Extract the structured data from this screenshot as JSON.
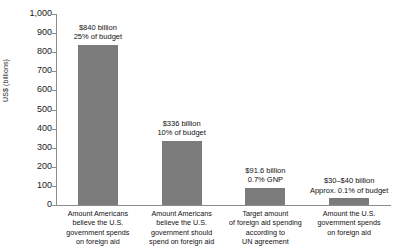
{
  "chart_data": {
    "type": "bar",
    "title": "",
    "subtitle": "",
    "xlabel": "",
    "ylabel": "US$ (billions)",
    "ylim": [
      0,
      1000
    ],
    "ytick_values": [
      1000,
      900,
      800,
      700,
      600,
      500,
      400,
      300,
      200,
      100,
      0
    ],
    "ytick_labels": [
      "1,000",
      "900",
      "800",
      "700",
      "600",
      "500",
      "400",
      "300",
      "200",
      "100",
      "0"
    ],
    "grid": false,
    "legend": null,
    "bar_color": "#7b7b7b",
    "axis_color": "#8c8c8c",
    "categories": [
      "Amount Americans believe the U.S. government spends on foreign aid",
      "Amount Americans believe the U.S. government should spend on foreign aid",
      "Target amount of foreign aid spending according to UN agreement",
      "Amount the U.S. government spends on foreign aid"
    ],
    "category_lines": [
      [
        "Amount Americans",
        "believe the U.S.",
        "government spends",
        "on foreign aid"
      ],
      [
        "Amount Americans",
        "believe the U.S.",
        "government should",
        "spend on foreign aid"
      ],
      [
        "Target amount",
        "of foreign aid spending",
        "according to",
        "UN agreement"
      ],
      [
        "Amount the U.S.",
        "government spends",
        "on foreign aid"
      ]
    ],
    "values": [
      840,
      336,
      91.6,
      35
    ],
    "data_labels": [
      {
        "line1": "$840 billion",
        "line2": "25% of budget"
      },
      {
        "line1": "$336 billion",
        "line2": "10% of budget"
      },
      {
        "line1": "$91.6 billion",
        "line2": "0.7% GNP"
      },
      {
        "line1": "$30–$40 billion",
        "line2": "Approx. 0.1% of budget"
      }
    ]
  }
}
